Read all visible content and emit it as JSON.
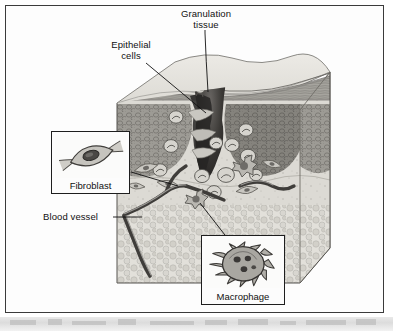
{
  "figure": {
    "kind": "biology-illustration",
    "style": "grayscale scanned textbook diagram",
    "border_color": "#3b3b3b",
    "background_color": "#ffffff"
  },
  "labels": {
    "granulation_tissue": "Granulation\ntissue",
    "epithelial_cells": "Epithelial\ncells",
    "blood_vessel": "Blood vessel"
  },
  "insets": [
    {
      "id": "fibroblast",
      "caption": "Fibroblast"
    },
    {
      "id": "macrophage",
      "caption": "Macrophage"
    }
  ],
  "structures": {
    "epidermis": "epidermis",
    "dermis": "dermis",
    "subcutaneous_fat": "subcutaneous fat",
    "wound_crater": "wound crater",
    "scab": "scab",
    "capillaries": "capillaries"
  },
  "colors": {
    "skin_surface": "#e4e2dd",
    "epidermis_band": "#8f8d87",
    "dermis": "#9a9892",
    "granulation": "#d9d7d1",
    "fat": "#dedcd6",
    "wound_dark": "#2c2a28",
    "vessel": "#4a4845",
    "line": "#111111"
  }
}
